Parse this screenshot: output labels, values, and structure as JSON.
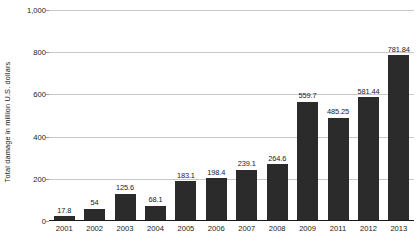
{
  "chart_data": {
    "type": "bar",
    "title": "",
    "subtitle": "",
    "xlabel": "",
    "ylabel": "Total damage in million U.S. dollars",
    "categories": [
      "2001",
      "2002",
      "2003",
      "2004",
      "2005",
      "2006",
      "2007",
      "2008",
      "2009",
      "2011",
      "2012",
      "2013"
    ],
    "values": [
      17.8,
      54,
      125.6,
      68.1,
      183.1,
      198.4,
      239.1,
      264.6,
      559.7,
      485.25,
      581.44,
      781.84
    ],
    "value_labels": [
      "17.8",
      "54",
      "125.6",
      "68.1",
      "183.1",
      "198.4",
      "239.1",
      "264.6",
      "559.7",
      "485.25",
      "581.44",
      "781.84"
    ],
    "ylim": [
      0,
      1000
    ],
    "yticks": [
      0,
      200,
      400,
      600,
      800,
      1000
    ],
    "ytick_labels": [
      "0",
      "200",
      "400",
      "600",
      "800",
      "1,000"
    ],
    "grid": true,
    "legend": false,
    "legend_position": "none",
    "bar_color": "#2b2b2b",
    "gridline_color": "#c8c8c8",
    "axis_color": "#1a1a1a",
    "background_color": "#ffffff",
    "data_labels_shown": true
  }
}
